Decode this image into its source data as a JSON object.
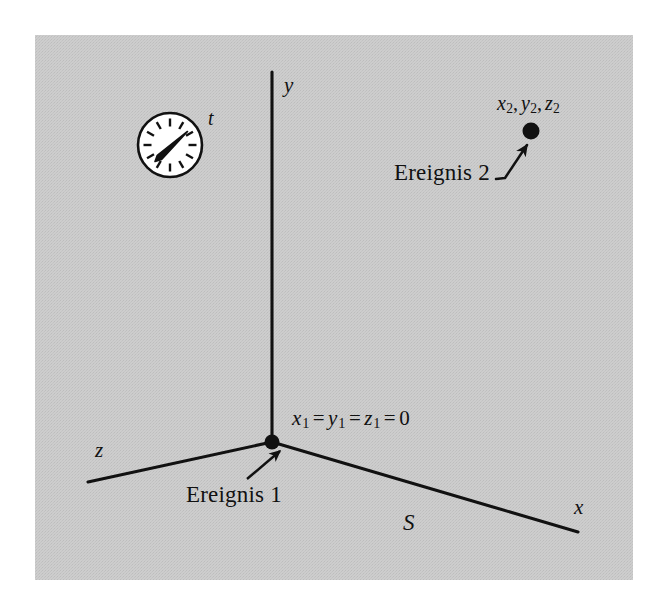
{
  "figure": {
    "background_color": "#c9c9c9",
    "page_color": "#ffffff",
    "ink_color": "#111111",
    "plate": {
      "x": 35,
      "y": 35,
      "width": 598,
      "height": 545
    }
  },
  "axes": {
    "origin": {
      "x": 272,
      "y": 442
    },
    "y_axis": {
      "label": "y",
      "label_pos": {
        "x": 284,
        "y": 75
      },
      "from": {
        "x": 272,
        "y": 72
      },
      "to": {
        "x": 272,
        "y": 442
      }
    },
    "x_axis": {
      "label": "x",
      "label_pos": {
        "x": 574,
        "y": 500
      },
      "from": {
        "x": 272,
        "y": 442
      },
      "to": {
        "x": 578,
        "y": 532
      }
    },
    "z_axis": {
      "label": "z",
      "label_pos": {
        "x": 95,
        "y": 444
      },
      "from": {
        "x": 272,
        "y": 442
      },
      "to": {
        "x": 88,
        "y": 482
      }
    }
  },
  "frame": {
    "label": "S",
    "label_pos": {
      "x": 403,
      "y": 512
    }
  },
  "clock": {
    "label": "t",
    "label_pos": {
      "x": 208,
      "y": 110
    },
    "center": {
      "x": 170,
      "y": 145
    },
    "radius": 33,
    "face_color": "#ffffff",
    "rim_color": "#111111",
    "tick_count": 12,
    "hand_angle_deg": -32,
    "hand_length": 26
  },
  "events": [
    {
      "name": "event-1",
      "label": "Ereignis 1",
      "label_pos": {
        "x": 186,
        "y": 483
      },
      "coords_text": "x₁ = y₁ = z₁ = 0",
      "coords": {
        "v1": "x",
        "s1": "1",
        "eq1": "=",
        "v2": "y",
        "s2": "1",
        "eq2": "=",
        "v3": "z",
        "s3": "1",
        "eq3": "=",
        "value": "0"
      },
      "coords_pos": {
        "x": 292,
        "y": 408
      },
      "dot": {
        "x": 272,
        "y": 442,
        "r": 7
      },
      "leader": {
        "from": {
          "x": 247,
          "y": 479
        },
        "to": {
          "x": 279,
          "y": 450
        }
      }
    },
    {
      "name": "event-2",
      "label": "Ereignis 2",
      "label_pos": {
        "x": 394,
        "y": 160
      },
      "coords_text": "x₂, y₂, z₂",
      "coords": {
        "v1": "x",
        "s1": "2",
        "v2": "y",
        "s2": "2",
        "v3": "z",
        "s3": "2",
        "sep": ","
      },
      "coords_pos": {
        "x": 497,
        "y": 94
      },
      "dot": {
        "x": 531,
        "y": 131,
        "r": 8
      },
      "leader": {
        "from": {
          "x": 501,
          "y": 177
        },
        "to": {
          "x": 527,
          "y": 144
        }
      }
    }
  ]
}
